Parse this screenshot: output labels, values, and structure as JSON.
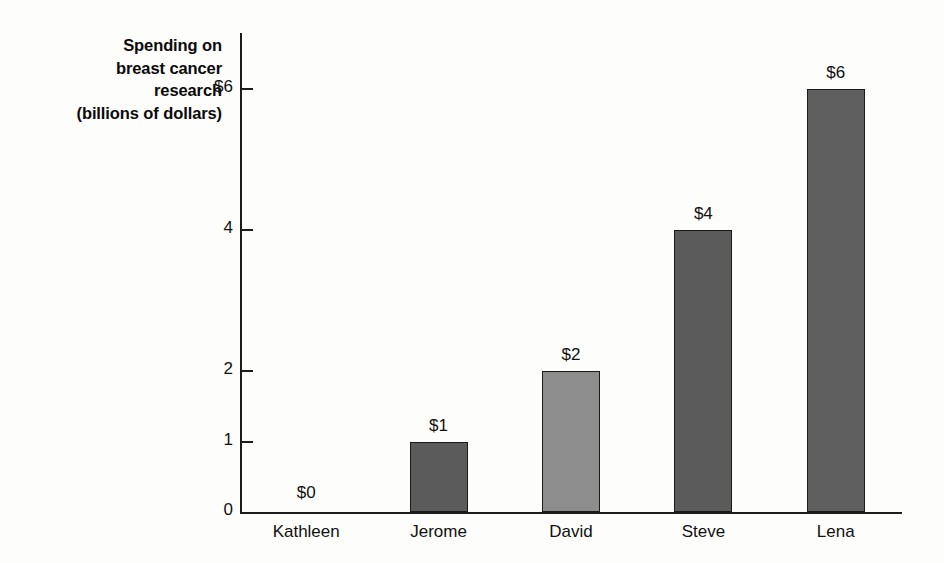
{
  "chart_data": {
    "type": "bar",
    "title": "",
    "subtitle": "",
    "xlabel": "",
    "ylabel": "Spending on breast cancer research (billions of dollars)",
    "ylabel_lines": [
      "Spending on",
      "breast cancer",
      "research",
      "(billions of dollars)"
    ],
    "categories": [
      "Kathleen",
      "Jerome",
      "David",
      "Steve",
      "Lena"
    ],
    "values": [
      0,
      1,
      2,
      4,
      6
    ],
    "data_labels": [
      "$0",
      "$1",
      "$2",
      "$4",
      "$6"
    ],
    "bar_colors": [
      "#ffffff",
      "#5b5b5b",
      "#8d8d8d",
      "#5b5b5b",
      "#5f5f5f"
    ],
    "bar_outline_color": "#1a1a1a",
    "ylim": [
      0,
      6.8
    ],
    "y_ticks": [
      0,
      1,
      2,
      4,
      6
    ],
    "y_tick_labels": [
      "0",
      "1",
      "2",
      "4",
      "$6"
    ],
    "grid": false,
    "legend": null,
    "legend_position": "none",
    "axis_color": "#1c1c1c",
    "background_color": "#fdfdfc"
  }
}
